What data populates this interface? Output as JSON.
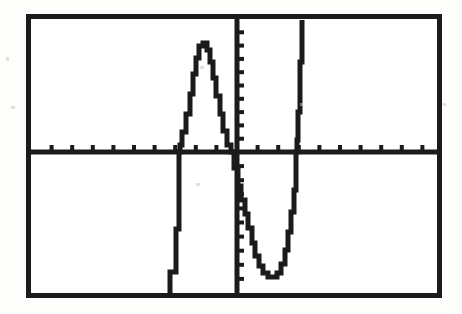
{
  "document": {
    "kind": "graphing-calculator-screen-scan",
    "background_color": "#fdfdfb",
    "ink_color": "#1b1b1b"
  },
  "screen": {
    "frame_color": "#1b1b1b",
    "frame_thickness_px": 5,
    "screen_background": "#ffffff"
  },
  "chart_data": {
    "type": "line",
    "title": "",
    "subtitle": "",
    "xlabel": "",
    "ylabel": "",
    "legend": [],
    "legend_position": "none",
    "grid": false,
    "axes": {
      "x_axis_visible": true,
      "y_axis_visible": true,
      "x_axis_label": "",
      "y_axis_label": "",
      "xlim": [
        -10,
        10
      ],
      "ylim": [
        -10,
        10
      ],
      "x_tick_step": 1,
      "y_tick_step": 1,
      "x_tick_count": 20,
      "y_tick_count": 20,
      "tick_direction": "positive-side",
      "tick_length_px": 7,
      "x_tick_labels": [],
      "y_tick_labels": []
    },
    "pixel_geometry": {
      "screen_left": 26,
      "screen_top": 14,
      "screen_width": 416,
      "screen_height": 284,
      "x_axis_y": 152,
      "y_axis_x": 237,
      "left_edge": 31,
      "right_edge": 437,
      "top_edge": 19,
      "bottom_edge": 293
    },
    "series": [
      {
        "name": "y1",
        "style": "stepped-pixel-plot",
        "color": "#1b1b1b",
        "line_width_px": 5,
        "description": "Steep descending branch on the left, a rounded local maximum hump, a deep rounded local minimum right of the y-axis, then a steep ascending branch on the right.",
        "points": [
          [
            170,
            295
          ],
          [
            170,
            272
          ],
          [
            176,
            272
          ],
          [
            176,
            229
          ],
          [
            179,
            229
          ],
          [
            179,
            152
          ],
          [
            180,
            152
          ],
          [
            180,
            145
          ],
          [
            182,
            145
          ],
          [
            182,
            132
          ],
          [
            186,
            132
          ],
          [
            186,
            114
          ],
          [
            190,
            114
          ],
          [
            190,
            94
          ],
          [
            193,
            94
          ],
          [
            193,
            74
          ],
          [
            196,
            74
          ],
          [
            196,
            58
          ],
          [
            199,
            58
          ],
          [
            199,
            46
          ],
          [
            203,
            46
          ],
          [
            203,
            43
          ],
          [
            207,
            43
          ],
          [
            207,
            50
          ],
          [
            210,
            50
          ],
          [
            210,
            62
          ],
          [
            213,
            62
          ],
          [
            213,
            78
          ],
          [
            216,
            78
          ],
          [
            216,
            96
          ],
          [
            220,
            96
          ],
          [
            220,
            114
          ],
          [
            223,
            114
          ],
          [
            223,
            131
          ],
          [
            227,
            131
          ],
          [
            227,
            145
          ],
          [
            231,
            145
          ],
          [
            231,
            152
          ],
          [
            234,
            152
          ],
          [
            234,
            168
          ],
          [
            238,
            168
          ],
          [
            238,
            186
          ],
          [
            241,
            186
          ],
          [
            241,
            200
          ],
          [
            245,
            200
          ],
          [
            245,
            214
          ],
          [
            248,
            214
          ],
          [
            248,
            228
          ],
          [
            252,
            228
          ],
          [
            252,
            243
          ],
          [
            255,
            243
          ],
          [
            255,
            256
          ],
          [
            259,
            256
          ],
          [
            259,
            266
          ],
          [
            263,
            266
          ],
          [
            263,
            273
          ],
          [
            268,
            273
          ],
          [
            268,
            277
          ],
          [
            277,
            277
          ],
          [
            277,
            273
          ],
          [
            281,
            273
          ],
          [
            281,
            264
          ],
          [
            285,
            264
          ],
          [
            285,
            250
          ],
          [
            288,
            250
          ],
          [
            288,
            232
          ],
          [
            291,
            232
          ],
          [
            291,
            212
          ],
          [
            294,
            212
          ],
          [
            294,
            190
          ],
          [
            296,
            190
          ],
          [
            296,
            152
          ],
          [
            297,
            152
          ],
          [
            297,
            140
          ],
          [
            298,
            140
          ],
          [
            298,
            112
          ],
          [
            300,
            112
          ],
          [
            300,
            62
          ],
          [
            302,
            62
          ],
          [
            302,
            20
          ]
        ]
      }
    ]
  }
}
